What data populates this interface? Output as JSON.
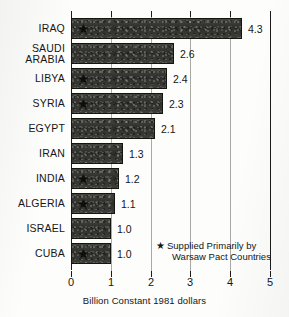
{
  "chart_data": {
    "type": "bar",
    "orientation": "horizontal",
    "title": "",
    "xlabel": "Billion Constant 1981 dollars",
    "ylabel": "",
    "xlim": [
      0,
      5
    ],
    "xticks": [
      0,
      1,
      2,
      3,
      4,
      5
    ],
    "xtick_labels": [
      "0",
      "1",
      "2",
      "3",
      "4",
      "5"
    ],
    "grid": false,
    "categories": [
      "IRAQ",
      "SAUDI ARABIA",
      "LIBYA",
      "SYRIA",
      "EGYPT",
      "IRAN",
      "INDIA",
      "ALGERIA",
      "ISRAEL",
      "CUBA"
    ],
    "values": [
      4.3,
      2.6,
      2.4,
      2.3,
      2.1,
      1.3,
      1.2,
      1.1,
      1.0,
      1.0
    ],
    "value_labels": [
      "4.3",
      "2.6",
      "2.4",
      "2.3",
      "2.1",
      "1.3",
      "1.2",
      "1.1",
      "1.0",
      "1.0"
    ],
    "starred": [
      true,
      false,
      true,
      true,
      false,
      false,
      true,
      true,
      false,
      true
    ],
    "bars": [
      {
        "category": "IRAQ",
        "label_line1": "IRAQ",
        "label_line2": "",
        "value": 4.3,
        "value_label": "4.3",
        "star": true
      },
      {
        "category": "SAUDI ARABIA",
        "label_line1": "SAUDI",
        "label_line2": "ARABIA",
        "value": 2.6,
        "value_label": "2.6",
        "star": false
      },
      {
        "category": "LIBYA",
        "label_line1": "LIBYA",
        "label_line2": "",
        "value": 2.4,
        "value_label": "2.4",
        "star": true
      },
      {
        "category": "SYRIA",
        "label_line1": "SYRIA",
        "label_line2": "",
        "value": 2.3,
        "value_label": "2.3",
        "star": true
      },
      {
        "category": "EGYPT",
        "label_line1": "EGYPT",
        "label_line2": "",
        "value": 2.1,
        "value_label": "2.1",
        "star": false
      },
      {
        "category": "IRAN",
        "label_line1": "IRAN",
        "label_line2": "",
        "value": 1.3,
        "value_label": "1.3",
        "star": false
      },
      {
        "category": "INDIA",
        "label_line1": "INDIA",
        "label_line2": "",
        "value": 1.2,
        "value_label": "1.2",
        "star": true
      },
      {
        "category": "ALGERIA",
        "label_line1": "ALGERIA",
        "label_line2": "",
        "value": 1.1,
        "value_label": "1.1",
        "star": true
      },
      {
        "category": "ISRAEL",
        "label_line1": "ISRAEL",
        "label_line2": "",
        "value": 1.0,
        "value_label": "1.0",
        "star": false
      },
      {
        "category": "CUBA",
        "label_line1": "CUBA",
        "label_line2": "",
        "value": 1.0,
        "value_label": "1.0",
        "star": true
      }
    ],
    "legend": {
      "position": "bottom-right",
      "marker": "★",
      "line1": "Supplied Primarily by",
      "line2": "Warsaw Pact Countries"
    },
    "colors": {
      "bar_fill": "#3a3a38",
      "bar_edge": "#15150f",
      "axis": "#1b1b1b",
      "text": "#161616",
      "background": "#fdfdfc"
    }
  }
}
